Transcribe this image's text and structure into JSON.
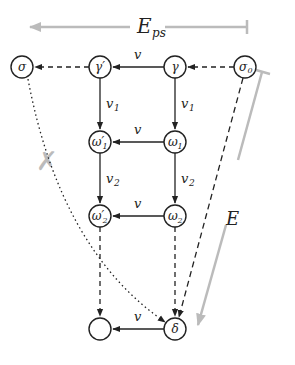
{
  "diagram": {
    "top_arrow_label": "E",
    "top_arrow_sub": "ps",
    "side_arrow_label": "E",
    "cross_mark": "✗",
    "nodes": {
      "sigma": {
        "label": "σ",
        "x": 22,
        "y": 67
      },
      "gamma_prime": {
        "label": "γ′",
        "x": 100,
        "y": 67
      },
      "gamma": {
        "label": "γ",
        "x": 175,
        "y": 67
      },
      "sigma0": {
        "label": "σ",
        "sub": "0",
        "x": 245,
        "y": 67
      },
      "omega1_prime": {
        "label": "ω′",
        "sub": "1",
        "x": 100,
        "y": 142
      },
      "omega1": {
        "label": "ω",
        "sub": "1",
        "x": 175,
        "y": 142
      },
      "omega2_prime": {
        "label": "ω′",
        "sub": "2",
        "x": 100,
        "y": 216
      },
      "omega2": {
        "label": "ω",
        "sub": "2",
        "x": 175,
        "y": 216
      },
      "empty": {
        "label": "",
        "x": 100,
        "y": 329
      },
      "delta": {
        "label": "δ",
        "x": 175,
        "y": 329
      }
    },
    "edge_labels": {
      "v_top": "v",
      "v_mid": "v",
      "v_low": "v",
      "v_bottom": "v",
      "v1_left": "v",
      "v1_left_sub": "1",
      "v1_right": "v",
      "v1_right_sub": "1",
      "v2_left": "v",
      "v2_left_sub": "2",
      "v2_right": "v",
      "v2_right_sub": "2"
    },
    "colors": {
      "line": "#222222",
      "gray": "#b8b8b8"
    }
  }
}
